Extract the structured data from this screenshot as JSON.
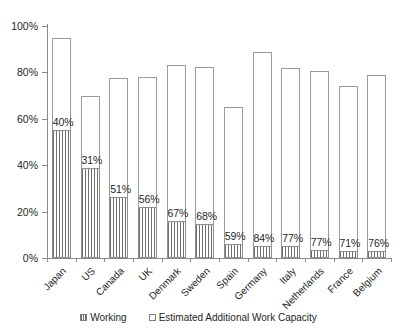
{
  "chart_data": {
    "type": "bar",
    "title": "",
    "subtitle": "",
    "xlabel": "",
    "ylabel": "",
    "ylim": [
      0,
      100
    ],
    "ytick_labels": [
      "0%",
      "20%",
      "40%",
      "60%",
      "80%",
      "100%"
    ],
    "ytick_values": [
      0,
      20,
      40,
      60,
      80,
      100
    ],
    "grid": false,
    "stacked": true,
    "legend_position": "bottom",
    "categories": [
      "Japan",
      "US",
      "Canada",
      "UK",
      "Denmark",
      "Sweden",
      "Spain",
      "Germany",
      "Italy",
      "Netherlands",
      "France",
      "Belgium"
    ],
    "series": [
      {
        "name": "Working",
        "fill": "hatched",
        "values": [
          55,
          39,
          26.5,
          22,
          16,
          14.5,
          6,
          5,
          5,
          3.5,
          3,
          3
        ]
      },
      {
        "name": "Estimated Additional Work Capacity",
        "fill": "white",
        "values": [
          40,
          31,
          51,
          56,
          67,
          68,
          59,
          84,
          77,
          77,
          71,
          76
        ]
      }
    ],
    "totals": [
      95,
      70,
      77.5,
      78,
      83,
      82.5,
      65,
      89,
      82,
      80.5,
      74,
      79
    ],
    "data_labels": [
      "40%",
      "31%",
      "51%",
      "56%",
      "67%",
      "68%",
      "59%",
      "84%",
      "77%",
      "77%",
      "71%",
      "76%"
    ],
    "annotations": []
  },
  "legend": {
    "entries": [
      {
        "label": "Working"
      },
      {
        "label": "Estimated Additional Work Capacity"
      }
    ]
  },
  "colors": {
    "axis": "#8a8a8a",
    "bar_outline": "#9a9a9a",
    "hatch": "#6e6e6e",
    "text": "#1f1f1f",
    "background": "#ffffff"
  }
}
